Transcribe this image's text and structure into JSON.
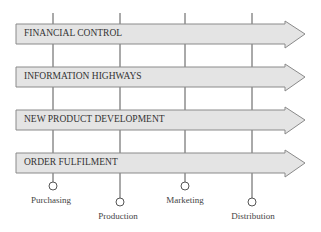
{
  "diagram": {
    "processes": [
      {
        "label": "FINANCIAL CONTROL"
      },
      {
        "label": "INFORMATION HIGHWAYS"
      },
      {
        "label": "NEW PRODUCT DEVELOPMENT"
      },
      {
        "label": "ORDER FULFILMENT"
      }
    ],
    "departments": [
      {
        "label": "Purchasing"
      },
      {
        "label": "Production"
      },
      {
        "label": "Marketing"
      },
      {
        "label": "Distribution"
      }
    ],
    "colors": {
      "arrow_fill": "#e4e4e4",
      "arrow_stroke": "#888888",
      "line": "#555555"
    }
  }
}
